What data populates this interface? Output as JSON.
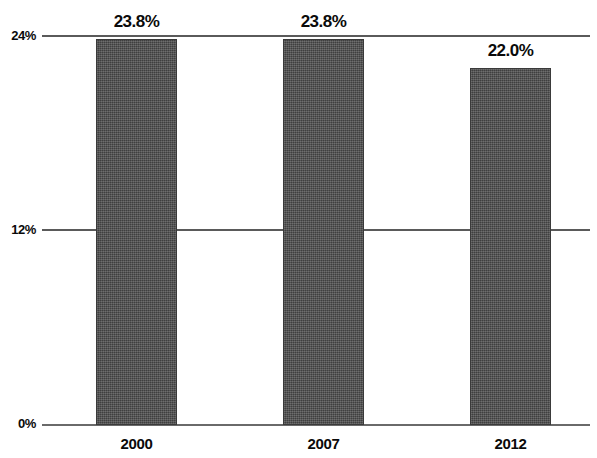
{
  "chart_data": {
    "type": "bar",
    "title": "",
    "subtitle": "",
    "xlabel": "",
    "ylabel": "",
    "categories": [
      "2000",
      "2007",
      "2012"
    ],
    "values": [
      23.8,
      23.8,
      22.0
    ],
    "data_labels": [
      "23.8%",
      "23.8%",
      "22.0%"
    ],
    "ylim": [
      0,
      24
    ],
    "y_ticks": [
      0,
      12,
      24
    ],
    "y_tick_labels": [
      "0%",
      "12%",
      "24%"
    ],
    "grid": true,
    "legend": "none",
    "bar_color": "#4d4d4d",
    "axis_color": "#5a5a5a",
    "background_color": "#ffffff",
    "series": [
      {
        "name": "",
        "values": [
          23.8,
          23.8,
          22.0
        ]
      }
    ]
  },
  "axis": {
    "y_tick_0": "0%",
    "y_tick_12": "12%",
    "y_tick_24": "24%"
  },
  "bars": [
    {
      "category": "2000",
      "value": 23.8,
      "label": "23.8%"
    },
    {
      "category": "2007",
      "value": 23.8,
      "label": "23.8%"
    },
    {
      "category": "2012",
      "value": 22.0,
      "label": "22.0%"
    }
  ]
}
